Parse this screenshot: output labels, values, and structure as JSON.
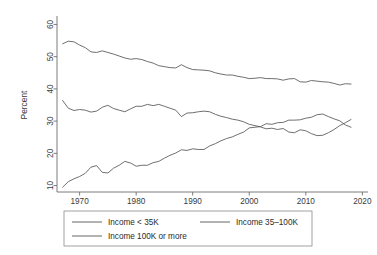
{
  "chart_data": {
    "type": "line",
    "title": "",
    "subtitle": "",
    "xlabel": "",
    "ylabel": "Percent",
    "xlim": [
      1966,
      2021
    ],
    "ylim": [
      8,
      62
    ],
    "xticks": [
      1970,
      1980,
      1990,
      2000,
      2010,
      2020
    ],
    "xticklabels": [
      "1970",
      "1980",
      "1990",
      "2000",
      "2010",
      "2020"
    ],
    "yticks": [
      10,
      20,
      30,
      40,
      50,
      60
    ],
    "yticklabels": [
      "10",
      "20",
      "30",
      "40",
      "50",
      "60"
    ],
    "grid": false,
    "legend_position": "bottom",
    "x": [
      1967,
      1968,
      1969,
      1970,
      1971,
      1972,
      1973,
      1974,
      1975,
      1976,
      1977,
      1978,
      1979,
      1980,
      1981,
      1982,
      1983,
      1984,
      1985,
      1986,
      1987,
      1988,
      1989,
      1990,
      1991,
      1992,
      1993,
      1994,
      1995,
      1996,
      1997,
      1998,
      1999,
      2000,
      2001,
      2002,
      2003,
      2004,
      2005,
      2006,
      2007,
      2008,
      2009,
      2010,
      2011,
      2012,
      2013,
      2014,
      2015,
      2016,
      2017,
      2018
    ],
    "series": [
      {
        "name": "Income < 35K",
        "color": "#555555",
        "values": [
          54.0,
          54.8,
          54.6,
          53.6,
          52.8,
          51.5,
          51.3,
          51.8,
          51.3,
          50.8,
          50.2,
          49.6,
          49.2,
          49.4,
          49.1,
          48.5,
          48.0,
          47.2,
          46.9,
          46.6,
          46.5,
          47.5,
          46.6,
          46.0,
          45.9,
          45.8,
          45.6,
          45.0,
          44.6,
          44.3,
          44.3,
          43.9,
          43.6,
          43.2,
          43.3,
          43.5,
          43.2,
          43.2,
          43.1,
          42.7,
          43.1,
          43.2,
          42.2,
          42.1,
          42.6,
          42.4,
          42.2,
          42.1,
          41.7,
          41.2,
          41.6,
          41.5
        ]
      },
      {
        "name": "Income 35-100K",
        "color": "#555555",
        "values": [
          36.4,
          34.0,
          33.3,
          33.6,
          33.4,
          32.8,
          33.1,
          34.3,
          34.9,
          33.9,
          33.4,
          32.9,
          33.8,
          34.6,
          34.6,
          35.2,
          34.8,
          35.2,
          34.6,
          34.0,
          33.4,
          31.4,
          32.5,
          32.6,
          32.9,
          33.1,
          32.9,
          32.1,
          31.5,
          31.1,
          30.6,
          30.3,
          29.8,
          29.0,
          28.6,
          28.2,
          27.6,
          27.8,
          27.4,
          27.7,
          26.6,
          26.4,
          27.3,
          27.0,
          26.1,
          25.5,
          25.6,
          26.4,
          27.4,
          28.6,
          29.5,
          30.5
        ]
      },
      {
        "name": "Income 100K or more",
        "color": "#555555",
        "values": [
          9.5,
          11.2,
          12.1,
          12.8,
          13.8,
          15.7,
          16.2,
          14.1,
          13.9,
          15.4,
          16.3,
          17.5,
          17.0,
          16.0,
          16.3,
          16.3,
          17.1,
          17.5,
          18.5,
          19.4,
          20.1,
          21.1,
          20.9,
          21.4,
          21.2,
          21.2,
          22.3,
          23.0,
          23.9,
          24.6,
          25.1,
          25.9,
          26.6,
          27.9,
          28.1,
          28.3,
          29.2,
          29.0,
          29.5,
          29.6,
          30.3,
          30.3,
          30.4,
          30.9,
          31.2,
          32.0,
          32.2,
          31.4,
          30.7,
          30.1,
          28.8,
          28.1
        ]
      }
    ]
  },
  "legend": {
    "entries": [
      {
        "label": "Income < 35K",
        "color": "#555555"
      },
      {
        "label": "Income 35–100K",
        "color": "#555555"
      },
      {
        "label": "Income 100K or more",
        "color": "#555555"
      }
    ]
  },
  "axes": {
    "y_title": "Percent"
  }
}
